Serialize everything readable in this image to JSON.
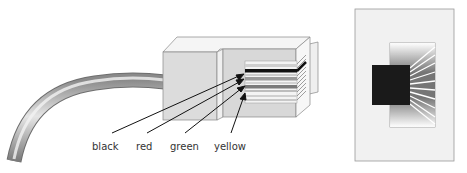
{
  "diagram": {
    "type": "RJ-11 connector wiring",
    "side_view": {
      "wire_labels": [
        {
          "text": "black",
          "color_hex": "#111111"
        },
        {
          "text": "red",
          "color_hex": "#666666"
        },
        {
          "text": "green",
          "color_hex": "#888888"
        },
        {
          "text": "yellow",
          "color_hex": "#bbbbbb"
        }
      ]
    },
    "end_view": {
      "description": "front view of connector showing contacts"
    }
  }
}
